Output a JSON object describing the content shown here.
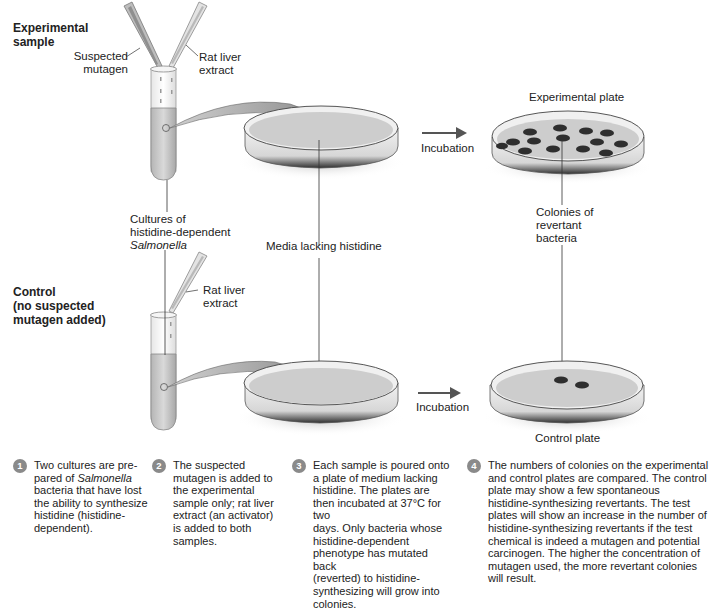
{
  "figure": {
    "rows": {
      "experimental": {
        "heading_line1": "Experimental",
        "heading_line2": "sample",
        "pipette_left_label_1": "Suspected",
        "pipette_left_label_2": "mutagen",
        "pipette_right_label_1": "Rat liver",
        "pipette_right_label_2": "extract",
        "plate_label": "Experimental plate",
        "incubation_label": "Incubation",
        "colony_count": 14
      },
      "control": {
        "heading_line1": "Control",
        "heading_line2": "(no suspected",
        "heading_line3": "mutagen added)",
        "pipette_label_1": "Rat liver",
        "pipette_label_2": "extract",
        "plate_label": "Control plate",
        "incubation_label": "Incubation",
        "colony_count": 2
      }
    },
    "center_labels": {
      "cultures_line1": "Cultures of",
      "cultures_line2": "histidine-dependent",
      "cultures_line3": "Salmonella",
      "media": "Media lacking histidine",
      "colonies_line1": "Colonies of",
      "colonies_line2": "revertant",
      "colonies_line3": "bacteria"
    },
    "steps": [
      {
        "number": "1",
        "pre": "Two cultures are pre-\npared of ",
        "italic": "Salmonella",
        "post": "\nbacteria that have lost\nthe ability to synthesize\nhistidine (histidine-\ndependent)."
      },
      {
        "number": "2",
        "text": "The suspected\nmutagen is added to\nthe experimental\nsample only; rat liver\nextract (an activator)\nis added to both\nsamples."
      },
      {
        "number": "3",
        "text": "Each sample is poured onto\na plate of medium lacking\nhistidine. The plates are\nthen incubated at 37°C for two\ndays. Only bacteria whose\nhistidine-dependent\nphenotype has mutated back\n(reverted) to histidine-\nsynthesizing will grow into\ncolonies."
      },
      {
        "number": "4",
        "text": "The numbers of colonies on the experimental\nand control plates are compared. The control\nplate may show a few spontaneous\nhistidine-synthesizing revertants. The test\nplates will show an increase in the number of\nhistidine-synthesizing revertants if the test\nchemical is indeed a mutagen and potential\ncarcinogen. The higher the concentration of\nmutagen used, the more revertant colonies\nwill result."
      }
    ],
    "colors": {
      "medium": "#c9c9c9",
      "plate_rim": "#3a3a3a",
      "colony": "#2e2e2e",
      "arrow": "#555555",
      "step_badge": "#8a8a8a"
    }
  }
}
